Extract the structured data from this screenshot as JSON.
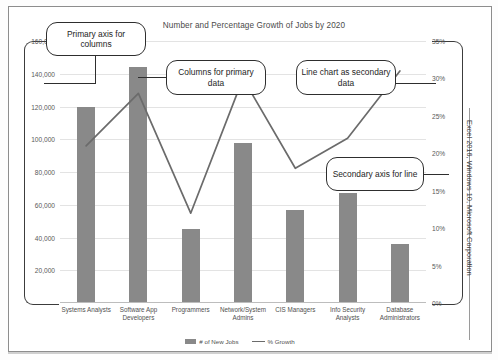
{
  "chart_data": {
    "type": "bar",
    "title": "Number and Percentage Growth of Jobs by 2020",
    "xlabel": "",
    "ylabel": "",
    "grid": true,
    "legend_position": "bottom",
    "categories": [
      "Systems Analysts",
      "Software App Developers",
      "Programmers",
      "Network/System Admins",
      "CIS Managers",
      "Info Security Analysts",
      "Database Administrators"
    ],
    "category_lines": [
      [
        "Systems Analysts"
      ],
      [
        "Software App",
        "Developers"
      ],
      [
        "Programmers"
      ],
      [
        "Network/System",
        "Admins"
      ],
      [
        "CIS Managers"
      ],
      [
        "Info Security",
        "Analysts"
      ],
      [
        "Database",
        "Administrators"
      ]
    ],
    "series": [
      {
        "name": "# of New Jobs",
        "type": "bar",
        "axis": "primary",
        "color": "#898989",
        "values": [
          120000,
          144000,
          45000,
          98000,
          57000,
          67000,
          36000
        ]
      },
      {
        "name": "% Growth",
        "type": "line",
        "axis": "secondary",
        "color": "#6b6b6b",
        "values": [
          21,
          28,
          12,
          30,
          18,
          22,
          31
        ]
      }
    ],
    "primary_axis": {
      "ylim": [
        0,
        160000
      ],
      "ticks": [
        20000,
        40000,
        60000,
        80000,
        100000,
        120000,
        140000,
        160000
      ],
      "tick_labels": [
        "20,000",
        "40,000",
        "60,000",
        "80,000",
        "100,000",
        "120,000",
        "140,000",
        "160,000"
      ]
    },
    "secondary_axis": {
      "ylim": [
        0,
        35
      ],
      "ticks": [
        0,
        5,
        10,
        15,
        20,
        25,
        30,
        35
      ],
      "tick_labels": [
        "0%",
        "5%",
        "10%",
        "15%",
        "20%",
        "25%",
        "30%",
        "35%"
      ]
    }
  },
  "annotations": [
    {
      "id": "primary-axis-callout",
      "text": "Primary axis for columns"
    },
    {
      "id": "columns-callout",
      "text": "Columns for primary data"
    },
    {
      "id": "line-chart-callout",
      "text": "Line chart as secondary data"
    },
    {
      "id": "secondary-axis-callout",
      "text": "Secondary axis for line"
    }
  ],
  "credit": "Excel 2016, Windows 10, Microsoft Corporation"
}
